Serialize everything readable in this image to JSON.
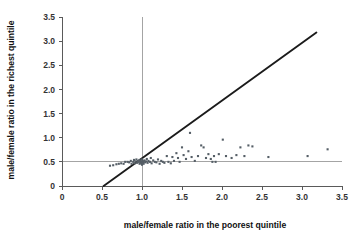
{
  "chart_data": {
    "type": "scatter",
    "title": "",
    "xlabel": "male/female ratio in the poorest quintile",
    "ylabel": "male/female ratio in the richest quintile",
    "xlim": [
      0,
      3.5
    ],
    "ylim": [
      0,
      3.5
    ],
    "xticks": [
      0,
      0.5,
      1.0,
      1.5,
      2.0,
      2.5,
      3.0,
      3.5
    ],
    "yticks": [
      0,
      0.5,
      1.0,
      1.5,
      2.0,
      2.5,
      3.0,
      3.5
    ],
    "xticklabels": [
      "0",
      "0.5",
      "1.0",
      "1.5",
      "2.0",
      "2.5",
      "3.0",
      "3.5"
    ],
    "yticklabels": [
      "0",
      "0.5",
      "1.0",
      "1.5",
      "2.0",
      "2.5",
      "3.0",
      "3.5"
    ],
    "grid": false,
    "legend": null,
    "marker_color": "#555e66",
    "marker_size": 2.1,
    "reference_lines": [
      {
        "name": "vertical-reference-line",
        "orientation": "vertical",
        "value": 1.0,
        "color": "#9a9a9a"
      },
      {
        "name": "horizontal-reference-line",
        "orientation": "horizontal",
        "value": 0.5,
        "color": "#9a9a9a"
      }
    ],
    "identity_line": {
      "name": "identity-line",
      "description": "45 degree line y = x",
      "from": [
        0.52,
        0.0
      ],
      "to": [
        3.18,
        3.18
      ],
      "color": "#1b1b1b"
    },
    "points": [
      [
        0.6,
        0.42
      ],
      [
        0.64,
        0.43
      ],
      [
        0.68,
        0.45
      ],
      [
        0.71,
        0.46
      ],
      [
        0.74,
        0.47
      ],
      [
        0.77,
        0.46
      ],
      [
        0.79,
        0.5
      ],
      [
        0.82,
        0.5
      ],
      [
        0.84,
        0.49
      ],
      [
        0.86,
        0.52
      ],
      [
        0.87,
        0.46
      ],
      [
        0.89,
        0.5
      ],
      [
        0.9,
        0.54
      ],
      [
        0.91,
        0.47
      ],
      [
        0.92,
        0.51
      ],
      [
        0.93,
        0.55
      ],
      [
        0.94,
        0.48
      ],
      [
        0.95,
        0.52
      ],
      [
        0.96,
        0.5
      ],
      [
        0.97,
        0.46
      ],
      [
        0.97,
        0.54
      ],
      [
        0.98,
        0.49
      ],
      [
        0.98,
        0.52
      ],
      [
        0.99,
        0.47
      ],
      [
        0.99,
        0.51
      ],
      [
        1.0,
        0.44
      ],
      [
        1.0,
        0.5
      ],
      [
        1.0,
        0.55
      ],
      [
        1.01,
        0.48
      ],
      [
        1.01,
        0.52
      ],
      [
        1.02,
        0.5
      ],
      [
        1.02,
        0.46
      ],
      [
        1.03,
        0.53
      ],
      [
        1.04,
        0.49
      ],
      [
        1.05,
        0.51
      ],
      [
        1.06,
        0.56
      ],
      [
        1.07,
        0.48
      ],
      [
        1.08,
        0.52
      ],
      [
        1.1,
        0.5
      ],
      [
        1.11,
        0.58
      ],
      [
        1.12,
        0.47
      ],
      [
        1.14,
        0.53
      ],
      [
        1.16,
        0.5
      ],
      [
        1.18,
        0.49
      ],
      [
        1.2,
        0.55
      ],
      [
        1.22,
        0.46
      ],
      [
        1.24,
        0.52
      ],
      [
        1.26,
        0.5
      ],
      [
        1.28,
        0.48
      ],
      [
        1.31,
        0.62
      ],
      [
        1.33,
        0.5
      ],
      [
        1.36,
        0.47
      ],
      [
        1.38,
        0.6
      ],
      [
        1.4,
        0.52
      ],
      [
        1.43,
        0.68
      ],
      [
        1.45,
        0.58
      ],
      [
        1.47,
        0.5
      ],
      [
        1.5,
        0.8
      ],
      [
        1.52,
        0.64
      ],
      [
        1.55,
        0.56
      ],
      [
        1.58,
        0.72
      ],
      [
        1.6,
        1.1
      ],
      [
        1.62,
        0.6
      ],
      [
        1.66,
        0.52
      ],
      [
        1.7,
        0.62
      ],
      [
        1.74,
        0.84
      ],
      [
        1.77,
        0.8
      ],
      [
        1.8,
        0.58
      ],
      [
        1.83,
        0.66
      ],
      [
        1.86,
        0.56
      ],
      [
        1.88,
        0.5
      ],
      [
        1.9,
        0.62
      ],
      [
        1.92,
        0.5
      ],
      [
        1.96,
        0.66
      ],
      [
        2.01,
        0.96
      ],
      [
        2.05,
        0.62
      ],
      [
        2.12,
        0.58
      ],
      [
        2.18,
        0.64
      ],
      [
        2.23,
        0.8
      ],
      [
        2.28,
        0.62
      ],
      [
        2.33,
        0.84
      ],
      [
        2.38,
        0.82
      ],
      [
        2.58,
        0.6
      ],
      [
        3.07,
        0.62
      ],
      [
        3.32,
        0.76
      ]
    ]
  }
}
